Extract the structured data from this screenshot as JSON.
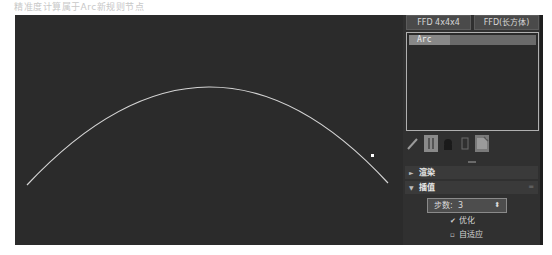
{
  "caption": "精准度计算属于Arc新规则节点",
  "viewport": {
    "background": "#2b2b2b",
    "curve": {
      "type": "arc",
      "color": "#d8d8d8",
      "start": [
        12,
        170
      ],
      "peak": [
        195,
        72
      ],
      "end": [
        373,
        168
      ]
    },
    "cursor_point": [
      357,
      140
    ]
  },
  "panel": {
    "buttons": [
      {
        "label": "FFD 4x4x4"
      },
      {
        "label": "FFD(长方体)"
      }
    ],
    "list": {
      "items": [
        {
          "label": "Arc",
          "selected": true
        }
      ]
    },
    "tools": [
      {
        "name": "pin",
        "active": false
      },
      {
        "name": "show-end-result",
        "active": true
      },
      {
        "name": "make-unique",
        "active": false
      },
      {
        "name": "remove-modifier",
        "active": false
      },
      {
        "name": "configure-modifier-sets",
        "active": false
      }
    ],
    "sections": [
      {
        "label": "渲染",
        "expanded": false
      },
      {
        "label": "插值",
        "expanded": true
      }
    ],
    "interpolation": {
      "steps_label": "步数:",
      "steps_value": "3",
      "optimize_label": "优化",
      "optimize_checked": true,
      "adaptive_label": "自适应",
      "adaptive_checked": false
    }
  }
}
